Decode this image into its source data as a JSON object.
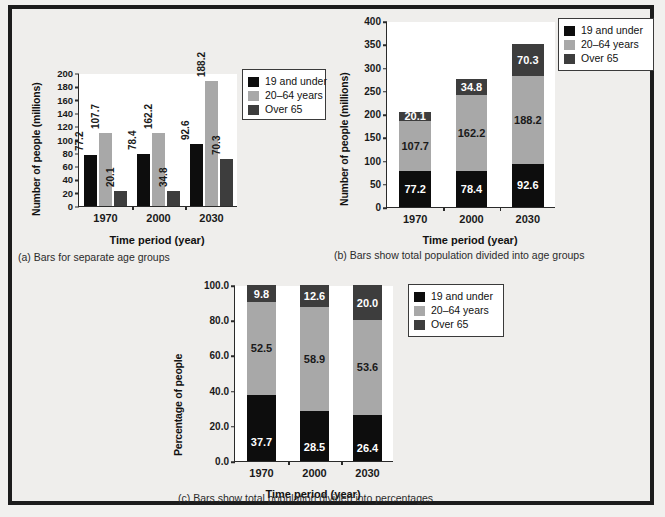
{
  "figure": {
    "background": "#efeeec",
    "frame_color": "#1c1c1c"
  },
  "colors": {
    "under19": "#0d0d0d",
    "age20to64": "#a8a8a8",
    "over65": "#3d3d3d",
    "axis": "#2a2a2a",
    "plot_bg": "#ffffff"
  },
  "legend": {
    "items": [
      {
        "label": "19 and under",
        "color": "#0d0d0d"
      },
      {
        "label": "20–64 years",
        "color": "#a8a8a8"
      },
      {
        "label": "Over 65",
        "color": "#3d3d3d"
      }
    ]
  },
  "chart_data": [
    {
      "id": "a",
      "type": "bar",
      "grouped": true,
      "title": "",
      "caption": "(a) Bars for separate age groups",
      "xlabel": "Time period (year)",
      "ylabel": "Number of people (millions)",
      "categories": [
        "1970",
        "2000",
        "2030"
      ],
      "ylim": [
        0,
        200
      ],
      "yticks": [
        "0",
        "20",
        "40",
        "60",
        "80",
        "100",
        "120",
        "140",
        "160",
        "180",
        "200"
      ],
      "ytick_values": [
        0,
        20,
        40,
        60,
        80,
        100,
        120,
        140,
        160,
        180,
        200
      ],
      "grid": false,
      "legend_position": "right",
      "series": [
        {
          "name": "19 and under",
          "color": "#0d0d0d",
          "values": [
            77.2,
            78.4,
            92.6
          ],
          "drawn_heights": [
            77.2,
            78.4,
            92.6
          ]
        },
        {
          "name": "20–64 years",
          "color": "#a8a8a8",
          "values": [
            107.7,
            162.2,
            188.2
          ],
          "drawn_heights": [
            110.0,
            110.0,
            188.2
          ]
        },
        {
          "name": "Over 65",
          "color": "#3d3d3d",
          "values": [
            20.1,
            34.8,
            70.3
          ],
          "drawn_heights": [
            22.0,
            22.5,
            70.3
          ]
        }
      ],
      "value_labels": [
        "77.2",
        "107.7",
        "20.1",
        "78.4",
        "162.2",
        "34.8",
        "92.6",
        "188.2",
        "70.3"
      ]
    },
    {
      "id": "b",
      "type": "bar",
      "stacked": true,
      "title": "",
      "caption": "(b) Bars show total population divided into age groups",
      "xlabel": "Time period (year)",
      "ylabel": "Number of people (millions)",
      "categories": [
        "1970",
        "2000",
        "2030"
      ],
      "ylim": [
        0,
        400
      ],
      "yticks": [
        "0",
        "50",
        "100",
        "150",
        "200",
        "250",
        "300",
        "350",
        "400"
      ],
      "ytick_values": [
        0,
        50,
        100,
        150,
        200,
        250,
        300,
        350,
        400
      ],
      "grid": false,
      "legend_position": "top-right",
      "series": [
        {
          "name": "19 and under",
          "color": "#0d0d0d",
          "values": [
            77.2,
            78.4,
            92.6
          ]
        },
        {
          "name": "20–64 years",
          "color": "#a8a8a8",
          "values": [
            107.7,
            162.2,
            188.2
          ]
        },
        {
          "name": "Over 65",
          "color": "#3d3d3d",
          "values": [
            20.1,
            34.8,
            70.3
          ]
        }
      ],
      "totals": [
        205.0,
        275.4,
        351.1
      ],
      "segment_labels": [
        [
          "77.2",
          "107.7",
          "20.1"
        ],
        [
          "78.4",
          "162.2",
          "34.8"
        ],
        [
          "92.6",
          "188.2",
          "70.3"
        ]
      ]
    },
    {
      "id": "c",
      "type": "bar",
      "stacked": true,
      "title": "",
      "caption": "(c) Bars show total population divided into percentages",
      "xlabel": "Time period (year)",
      "ylabel": "Percentage of people",
      "categories": [
        "1970",
        "2000",
        "2030"
      ],
      "ylim": [
        0,
        100
      ],
      "yticks": [
        "0.0",
        "20.0",
        "40.0",
        "60.0",
        "80.0",
        "100.0"
      ],
      "ytick_values": [
        0,
        20,
        40,
        60,
        80,
        100
      ],
      "grid": false,
      "legend_position": "right",
      "series": [
        {
          "name": "19 and under",
          "color": "#0d0d0d",
          "values": [
            37.7,
            28.5,
            26.4
          ]
        },
        {
          "name": "20–64 years",
          "color": "#a8a8a8",
          "values": [
            52.5,
            58.9,
            53.6
          ]
        },
        {
          "name": "Over 65",
          "color": "#3d3d3d",
          "values": [
            9.8,
            12.6,
            20.0
          ]
        }
      ],
      "segment_labels": [
        [
          "37.7",
          "52.5",
          "9.8"
        ],
        [
          "28.5",
          "58.9",
          "12.6"
        ],
        [
          "26.4",
          "53.6",
          "20.0"
        ]
      ]
    }
  ]
}
